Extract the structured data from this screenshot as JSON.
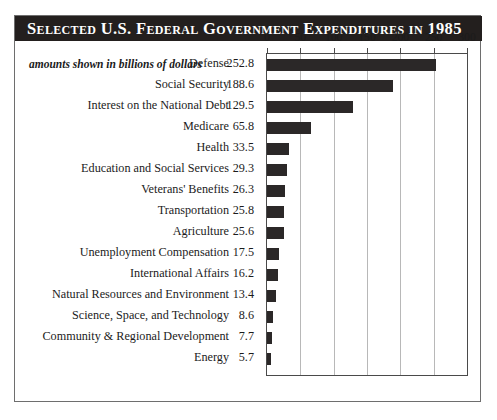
{
  "title": "Selected U.S. Federal Government Expenditures in 1985",
  "subtitle": "amounts shown in billions of dollars",
  "colors": {
    "bar": "#2b2828",
    "title_bar_background": "#231f1e",
    "title_text": "#ffffff",
    "gridline": "#b8b8b8",
    "frame": "#6e6e6e",
    "plot_border": "#4a4a4a",
    "page_background": "#ffffff"
  },
  "chart_data": {
    "type": "bar",
    "orientation": "horizontal",
    "title": "Selected U.S. Federal Government Expenditures in 1985",
    "subtitle": "amounts shown in billions of dollars",
    "xlabel": "",
    "ylabel": "",
    "xlim": [
      0,
      300
    ],
    "ticks": [
      0,
      50,
      100,
      150,
      200,
      250,
      300
    ],
    "tick_labels": [
      "0",
      "50",
      "100",
      "150",
      "200",
      "250",
      "300"
    ],
    "grid": true,
    "legend": false,
    "units": "billions of dollars",
    "categories": [
      "Defense",
      "Social Security",
      "Interest on the National Debt",
      "Medicare",
      "Health",
      "Education and Social Services",
      "Veterans' Benefits",
      "Transportation",
      "Agriculture",
      "Unemployment Compensation",
      "International Affairs",
      "Natural Resources and Environment",
      "Science, Space, and Technology",
      "Community & Regional Development",
      "Energy"
    ],
    "values": [
      252.8,
      188.6,
      129.5,
      65.8,
      33.5,
      29.3,
      26.3,
      25.8,
      25.6,
      17.5,
      16.2,
      13.4,
      8.6,
      7.7,
      5.7
    ],
    "value_labels": [
      "252.8",
      "188.6",
      "129.5",
      "65.8",
      "33.5",
      "29.3",
      "26.3",
      "25.8",
      "25.6",
      "17.5",
      "16.2",
      "13.4",
      "8.6",
      "7.7",
      "5.7"
    ]
  }
}
